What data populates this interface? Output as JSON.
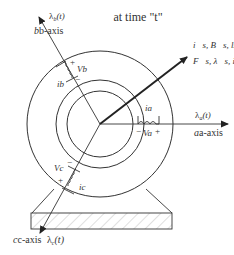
{
  "diagram": {
    "title": "at time \"t\"",
    "axes": {
      "a": {
        "axis_label": "a-axis",
        "flux_label": "λa(t)",
        "flux_sym": "λ",
        "flux_sub": "a",
        "flux_arg": "(t)"
      },
      "b": {
        "axis_label": "b-axis",
        "flux_label": "λb(t)",
        "flux_sym": "λ",
        "flux_sub": "b",
        "flux_arg": "(t)"
      },
      "c": {
        "axis_label": "c-axis",
        "flux_label": "λc(t)",
        "flux_sym": "λ",
        "flux_sub": "c",
        "flux_arg": "(t)"
      }
    },
    "space_vector_labels": {
      "line1": "i⃗s, B⃗s, ls",
      "line2": "F⃗s, λ⃗s, is"
    },
    "windings": {
      "a": {
        "current": "ia",
        "voltage": "Va",
        "plus": "+",
        "minus": "−"
      },
      "b": {
        "current": "ib",
        "voltage": "Vb",
        "plus": "+",
        "minus": "−"
      },
      "c": {
        "current": "ic",
        "voltage": "Vc",
        "plus": "+",
        "minus": "−"
      }
    },
    "colors": {
      "line": "#333333",
      "hatch": "#bbbbbb",
      "background": "#ffffff"
    }
  }
}
